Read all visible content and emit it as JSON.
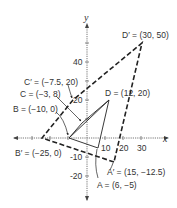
{
  "axes": {
    "x_label": "x",
    "y_label": "y",
    "x_ticks": [
      "10",
      "20",
      "30"
    ],
    "y_ticks": [
      "40",
      "20",
      "-10",
      "-20"
    ]
  },
  "original": {
    "points": {
      "A": {
        "label": "A = (6, −5)",
        "x": 6,
        "y": -5
      },
      "B": {
        "label": "B = (−10, 0)",
        "x": -10,
        "y": 0
      },
      "C": {
        "label": "C = (−3, 8)",
        "x": -3,
        "y": 8
      },
      "D": {
        "label": "D = (12, 20)",
        "x": 12,
        "y": 20
      }
    }
  },
  "image": {
    "points": {
      "A'": {
        "label": "A′ = (15, −12.5)",
        "x": 15,
        "y": -12.5
      },
      "B'": {
        "label": "B′ = (−25, 0)",
        "x": -25,
        "y": 0
      },
      "C'": {
        "label": "C′ = (−7.5, 20)",
        "x": -7.5,
        "y": 20
      },
      "D'": {
        "label": "D′ = (30, 50)",
        "x": 30,
        "y": 50
      }
    }
  },
  "colors": {
    "line": "#222222",
    "axis": "#555555",
    "text": "#333333"
  }
}
